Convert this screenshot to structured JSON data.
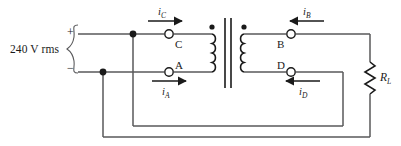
{
  "diagram": {
    "background_color": "#ffffff",
    "wire_color": "#58585a",
    "ink_color": "#1a1a1a"
  },
  "source": {
    "label": "240 V rms",
    "plus_sign": "+",
    "minus_sign": "−",
    "brace": "{"
  },
  "terminals": [
    {
      "id": "C",
      "label": "C",
      "marker": "open-circle"
    },
    {
      "id": "A",
      "label": "A",
      "marker": "open-circle"
    },
    {
      "id": "B",
      "label": "B",
      "marker": "open-circle"
    },
    {
      "id": "D",
      "label": "D",
      "marker": "open-circle"
    }
  ],
  "currents": [
    {
      "id": "iC",
      "label": "i",
      "subscript": "C",
      "direction": "right"
    },
    {
      "id": "iA",
      "label": "i",
      "subscript": "A",
      "direction": "right"
    },
    {
      "id": "iB",
      "label": "i",
      "subscript": "B",
      "direction": "left"
    },
    {
      "id": "iD",
      "label": "i",
      "subscript": "D",
      "direction": "left"
    }
  ],
  "load": {
    "label": "R",
    "subscript": "L",
    "type": "resistor-zigzag"
  },
  "transformer": {
    "primary_dot": true,
    "secondary_dot": true,
    "core": "two-vertical-bars"
  },
  "nodes": [
    {
      "id": "node-top",
      "x": 133,
      "y": 34
    },
    {
      "id": "node-bottom",
      "x": 103,
      "y": 72
    }
  ]
}
